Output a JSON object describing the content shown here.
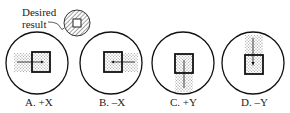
{
  "callout": {
    "line1": "Desired",
    "line2": "result"
  },
  "panels": [
    {
      "id": "A",
      "label": "A. +X",
      "direction": "+X"
    },
    {
      "id": "B",
      "label": "B. –X",
      "direction": "-X"
    },
    {
      "id": "C",
      "label": "C. +Y",
      "direction": "+Y"
    },
    {
      "id": "D",
      "label": "D. –Y",
      "direction": "-Y"
    }
  ]
}
